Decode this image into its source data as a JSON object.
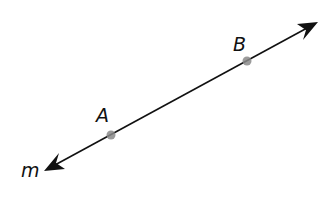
{
  "diagram": {
    "type": "geometry-line",
    "line": {
      "name": "m",
      "label": "m",
      "from": [
        44,
        171
      ],
      "to": [
        318,
        22
      ],
      "color": "#111111",
      "bidirectional": true
    },
    "points": [
      {
        "id": "A",
        "label": "A",
        "x": 111,
        "y": 135,
        "color": "#8a8a8a"
      },
      {
        "id": "B",
        "label": "B",
        "x": 247,
        "y": 61,
        "color": "#8a8a8a"
      }
    ]
  }
}
